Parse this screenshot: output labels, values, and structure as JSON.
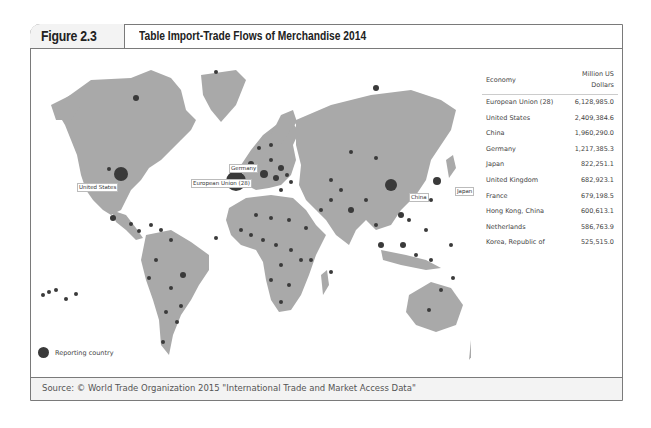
{
  "figure": {
    "label": "Figure 2.3",
    "title": "Table Import-Trade Flows of Merchandise 2014"
  },
  "map": {
    "labels": {
      "united_states": "United States",
      "european_union": "European Union (28)",
      "germany": "Germany",
      "china": "China",
      "japan": "Japan"
    },
    "legend": "Reporting country",
    "colors": {
      "land": "#a9a9a9",
      "marker": "#3a3a3a",
      "ocean": "#ffffff"
    }
  },
  "table": {
    "headers": {
      "economy": "Economy",
      "value_line1": "Million US",
      "value_line2": "Dollars"
    },
    "rows": [
      {
        "economy": "European Union (28)",
        "value": "6,128,985.0"
      },
      {
        "economy": "United States",
        "value": "2,409,384.6"
      },
      {
        "economy": "China",
        "value": "1,960,290.0"
      },
      {
        "economy": "Germany",
        "value": "1,217,385.3"
      },
      {
        "economy": "Japan",
        "value": "822,251.1"
      },
      {
        "economy": "United Kingdom",
        "value": "682,923.1"
      },
      {
        "economy": "France",
        "value": "679,198.5"
      },
      {
        "economy": "Hong Kong, China",
        "value": "600,613.1"
      },
      {
        "economy": "Netherlands",
        "value": "586,763.9"
      },
      {
        "economy": "Korea, Republic of",
        "value": "525,515.0"
      }
    ]
  },
  "source": "Source: © World Trade Organization 2015 \"International Trade and Market Access Data\""
}
